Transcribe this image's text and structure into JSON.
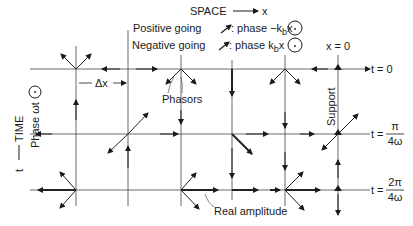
{
  "title": {
    "space_label": "SPACE",
    "space_axis": "x",
    "positive_going": "Positive going",
    "positive_phase": ": phase −k",
    "positive_phase_sub": "b",
    "positive_phase_tail": "x",
    "negative_going": "Negative going",
    "negative_phase": ": phase k",
    "negative_phase_sub": "b",
    "negative_phase_tail": "x"
  },
  "left_axis": {
    "time_label": "TIME",
    "t_label": "t",
    "phase_label": "Phase ωt"
  },
  "labels": {
    "x_zero": "x = 0",
    "delta_x": "Δx",
    "phasors": "Phasors",
    "support": "Support",
    "real_amplitude": "Real amplitude"
  },
  "time_rows": [
    {
      "prefix": "t = ",
      "value": "0"
    },
    {
      "prefix": "t = ",
      "num": "π",
      "den": "4ω"
    },
    {
      "prefix": "t = ",
      "num": "2π",
      "den": "4ω"
    }
  ],
  "colors": {
    "ink": "#1a1a1a",
    "background": "#ffffff"
  }
}
